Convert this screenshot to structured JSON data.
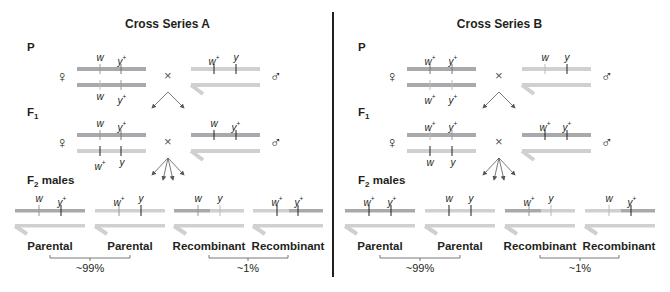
{
  "colors": {
    "dark_chromosome": "#a7a9ac",
    "light_chromosome": "#cfd0d2",
    "y_chromosome": "#cfd0d2",
    "tick": "#231f20",
    "text": "#231f20",
    "divider": "#231f20"
  },
  "symbols": {
    "female": "♀",
    "male": "♂",
    "cross": "×"
  },
  "generations": {
    "p": "P",
    "f1": "F",
    "f1_sub": "1",
    "f2": "F",
    "f2_sub": "2",
    "f2_suffix": " males"
  },
  "series": [
    {
      "title": "Cross Series A",
      "p": {
        "female_top": [
          "w",
          "y+"
        ],
        "female_bottom": [
          "w",
          "y+"
        ],
        "male_x": [
          "w+",
          "y"
        ]
      },
      "f1": {
        "female_top": [
          "w",
          "y+"
        ],
        "female_bottom": [
          "w+",
          "y"
        ],
        "male_x": [
          "w",
          "y+"
        ]
      },
      "f2_males": [
        {
          "alleles": [
            "w",
            "y+"
          ],
          "label": "Parental"
        },
        {
          "alleles": [
            "w+",
            "y"
          ],
          "label": "Parental"
        },
        {
          "alleles": [
            "w",
            "y"
          ],
          "label": "Recombinant"
        },
        {
          "alleles": [
            "w+",
            "y+"
          ],
          "label": "Recombinant"
        }
      ],
      "groups": [
        {
          "label": "~99%"
        },
        {
          "label": "~1%"
        }
      ]
    },
    {
      "title": "Cross Series B",
      "p": {
        "female_top": [
          "w+",
          "y+"
        ],
        "female_bottom": [
          "w+",
          "y+"
        ],
        "male_x": [
          "w",
          "y"
        ]
      },
      "f1": {
        "female_top": [
          "w+",
          "y+"
        ],
        "female_bottom": [
          "w",
          "y"
        ],
        "male_x": [
          "w+",
          "y+"
        ]
      },
      "f2_males": [
        {
          "alleles": [
            "w+",
            "y+"
          ],
          "label": "Parental"
        },
        {
          "alleles": [
            "w",
            "y"
          ],
          "label": "Parental"
        },
        {
          "alleles": [
            "w+",
            "y"
          ],
          "label": "Recombinant"
        },
        {
          "alleles": [
            "w",
            "y+"
          ],
          "label": "Recombinant"
        }
      ],
      "groups": [
        {
          "label": "~99%"
        },
        {
          "label": "~1%"
        }
      ]
    }
  ]
}
